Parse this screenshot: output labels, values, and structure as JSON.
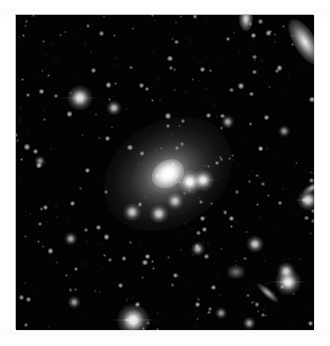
{
  "figure": {
    "kind": "astronomical-image",
    "caption": "",
    "background_color": "#ffffff",
    "sky_color": "#030303",
    "star_color": "#ffffff",
    "plate": {
      "x": 16,
      "y": 15,
      "width": 298,
      "height": 315
    }
  },
  "chart_data": {
    "type": "scatter",
    "title": "",
    "subtitle": "",
    "xlabel": "",
    "ylabel": "",
    "xlim": [
      0,
      298
    ],
    "ylim": [
      0,
      315
    ],
    "grid": false,
    "legend": null,
    "annotations": [],
    "tick_labels_x": [],
    "tick_labels_y": [],
    "series": [
      {
        "name": "central-galaxy",
        "kind": "extended-source",
        "points": [
          {
            "x": 152,
            "y": 159,
            "halo_rx": 68,
            "halo_ry": 52,
            "core_r": 13,
            "angle": -32,
            "peak": 1.0
          }
        ]
      },
      {
        "name": "bright-stars",
        "kind": "point-source",
        "points": [
          {
            "x": 174,
            "y": 167,
            "r": 6.0,
            "peak": 0.97
          },
          {
            "x": 187,
            "y": 165,
            "r": 5.2,
            "peak": 0.92
          },
          {
            "x": 117,
            "y": 305,
            "r": 7.5,
            "peak": 0.95
          },
          {
            "x": 272,
            "y": 267,
            "r": 6.2,
            "peak": 0.93
          },
          {
            "x": 64,
            "y": 83,
            "r": 6.0,
            "peak": 0.88
          },
          {
            "x": 292,
            "y": 185,
            "r": 5.0,
            "peak": 0.85
          },
          {
            "x": 270,
            "y": 256,
            "r": 4.2,
            "peak": 0.8
          },
          {
            "x": 239,
            "y": 229,
            "r": 4.0,
            "peak": 0.78
          },
          {
            "x": 143,
            "y": 199,
            "r": 4.6,
            "peak": 0.8
          },
          {
            "x": 116,
            "y": 197,
            "r": 4.2,
            "peak": 0.76
          },
          {
            "x": 98,
            "y": 93,
            "r": 3.6,
            "peak": 0.72
          },
          {
            "x": 159,
            "y": 186,
            "r": 4.0,
            "peak": 0.74
          },
          {
            "x": 182,
            "y": 234,
            "r": 3.4,
            "peak": 0.7
          },
          {
            "x": 55,
            "y": 224,
            "r": 3.2,
            "peak": 0.66
          },
          {
            "x": 212,
            "y": 107,
            "r": 3.2,
            "peak": 0.66
          },
          {
            "x": 233,
            "y": 308,
            "r": 3.0,
            "peak": 0.62
          },
          {
            "x": 58,
            "y": 287,
            "r": 3.0,
            "peak": 0.6
          },
          {
            "x": 268,
            "y": 116,
            "r": 2.8,
            "peak": 0.58
          },
          {
            "x": 205,
            "y": 298,
            "r": 2.8,
            "peak": 0.58
          },
          {
            "x": 24,
            "y": 146,
            "r": 2.6,
            "peak": 0.55
          }
        ]
      },
      {
        "name": "field-galaxies",
        "kind": "extended-source",
        "points": [
          {
            "x": 289,
            "y": 27,
            "rx": 26,
            "ry": 11,
            "angle": 58,
            "peak": 0.95,
            "label": "edge-spiral-top-right"
          },
          {
            "x": 230,
            "y": 4,
            "rx": 7,
            "ry": 12,
            "angle": 0,
            "peak": 0.9,
            "label": "clipped-source-top"
          },
          {
            "x": 252,
            "y": 278,
            "rx": 13,
            "ry": 4,
            "angle": 42,
            "peak": 0.72,
            "label": "edge-on-disk-lower-right"
          },
          {
            "x": 296,
            "y": 173,
            "rx": 10,
            "ry": 4,
            "angle": -28,
            "peak": 0.7,
            "label": "edge-on-disk-right"
          },
          {
            "x": 220,
            "y": 257,
            "rx": 9,
            "ry": 7,
            "angle": 0,
            "peak": 0.45,
            "label": "diffuse-lower-right"
          }
        ]
      }
    ],
    "faint_star_count": 420
  }
}
